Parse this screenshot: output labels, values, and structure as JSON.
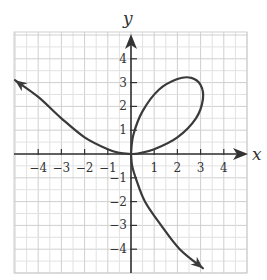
{
  "chart_data": {
    "type": "line",
    "title": "",
    "xlabel": "x",
    "ylabel": "y",
    "xlim": [
      -5,
      5
    ],
    "ylim": [
      -5,
      5
    ],
    "grid": true,
    "grid_minor_step": 0.5,
    "xticks": [
      -4,
      -3,
      -2,
      -1,
      1,
      2,
      3,
      4
    ],
    "yticks": [
      -4,
      -3,
      -2,
      -1,
      1,
      2,
      3,
      4
    ],
    "xtick_labels": [
      "−4",
      "−3",
      "−2",
      "−1",
      "1",
      "2",
      "3",
      "4"
    ],
    "ytick_labels": [
      "−4",
      "−3",
      "−2",
      "−1",
      "1",
      "2",
      "3",
      "4"
    ],
    "legend": null,
    "series": [
      {
        "name": "curve",
        "description": "Folium-like curve: loop in first quadrant through origin, left branch rising to upper-left with arrow, lower branch descending to lower-right with arrow",
        "color": "#3a3a3a",
        "loop_points": [
          [
            0,
            0
          ],
          [
            0.1,
            0.8
          ],
          [
            0.5,
            1.8
          ],
          [
            1.2,
            2.7
          ],
          [
            2.0,
            3.15
          ],
          [
            2.6,
            3.2
          ],
          [
            3.0,
            2.9
          ],
          [
            3.1,
            2.3
          ],
          [
            2.8,
            1.5
          ],
          [
            2.0,
            0.7
          ],
          [
            1.0,
            0.2
          ],
          [
            0.3,
            0.02
          ],
          [
            0,
            0
          ]
        ],
        "left_branch_points": [
          [
            0,
            0
          ],
          [
            -0.5,
            0.05
          ],
          [
            -1,
            0.2
          ],
          [
            -2,
            0.7
          ],
          [
            -3,
            1.5
          ],
          [
            -4,
            2.4
          ],
          [
            -5,
            3.1
          ]
        ],
        "lower_branch_points": [
          [
            0,
            0
          ],
          [
            0.05,
            -0.5
          ],
          [
            0.2,
            -1
          ],
          [
            0.6,
            -2
          ],
          [
            1.3,
            -3
          ],
          [
            2.1,
            -4
          ],
          [
            3.1,
            -4.8
          ]
        ]
      }
    ]
  },
  "labels": {
    "x_axis": "x",
    "y_axis": "y"
  },
  "colors": {
    "grid_minor": "#e2e2e2",
    "grid_major": "#cfcfcf",
    "axis": "#333333",
    "curve": "#3a3a3a"
  }
}
